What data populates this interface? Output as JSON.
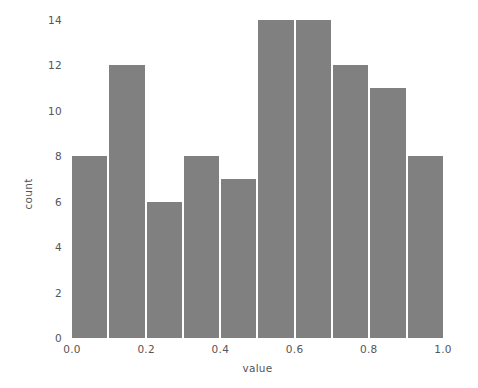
{
  "chart_data": {
    "type": "bar",
    "title": "",
    "subtitle": "",
    "xlabel": "value",
    "ylabel": "count",
    "categories": [
      "0.0-0.1",
      "0.1-0.2",
      "0.2-0.3",
      "0.3-0.4",
      "0.4-0.5",
      "0.5-0.6",
      "0.6-0.7",
      "0.7-0.8",
      "0.8-0.9",
      "0.9-1.0"
    ],
    "values": [
      8,
      12,
      6,
      8,
      7,
      14,
      14,
      12,
      11,
      8
    ],
    "bin_edges": [
      0.0,
      0.1,
      0.2,
      0.3,
      0.4,
      0.5,
      0.6,
      0.7,
      0.8,
      0.9,
      1.0
    ],
    "bins": 10,
    "xlim": [
      0.0,
      1.0
    ],
    "ylim": [
      0,
      14
    ],
    "x_ticks": [
      "0.0",
      "0.2",
      "0.4",
      "0.6",
      "0.8",
      "1.0"
    ],
    "x_tick_values": [
      0.0,
      0.2,
      0.4,
      0.6,
      0.8,
      1.0
    ],
    "y_ticks": [
      "0",
      "2",
      "4",
      "6",
      "8",
      "10",
      "12",
      "14"
    ],
    "y_tick_values": [
      0,
      2,
      4,
      6,
      8,
      10,
      12,
      14
    ],
    "grid": false,
    "legend": null,
    "bar_color": "#808080",
    "bar_edge_color": "#ffffff",
    "background_color": "#ffffff",
    "tick_label_color": "#555555"
  }
}
